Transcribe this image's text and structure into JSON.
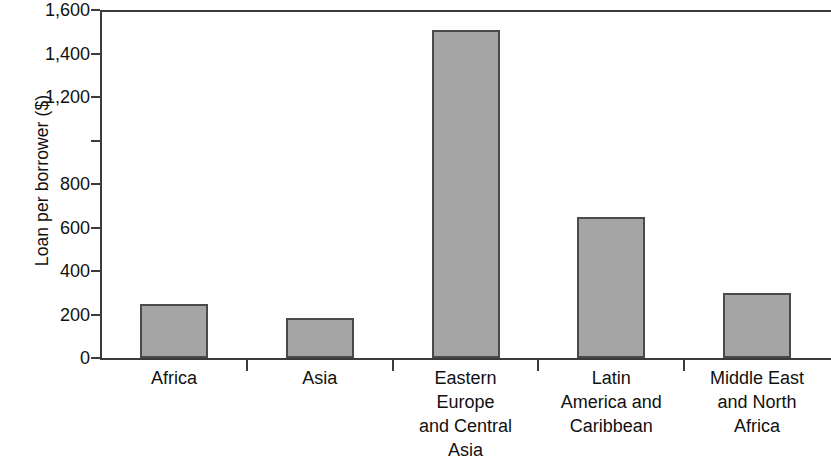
{
  "chart_data": {
    "type": "bar",
    "title": "",
    "subtitle": "",
    "xlabel": "",
    "ylabel": "Loan per borrower ($)",
    "categories": [
      "Africa",
      "Eastern Europe and Central Asia",
      "Asia",
      "Latin America and Caribbean",
      "Middle East and North Africa"
    ],
    "category_display_lines": [
      [
        "Africa"
      ],
      [
        "Asia"
      ],
      [
        "Eastern",
        "Europe",
        "and Central",
        "Asia"
      ],
      [
        "Latin",
        "America and",
        "Caribbean"
      ],
      [
        "Middle East",
        "and North",
        "Africa"
      ]
    ],
    "values": [
      250,
      185,
      1510,
      650,
      300
    ],
    "ylim": [
      0,
      1600
    ],
    "ytick_values": [
      0,
      200,
      400,
      600,
      800,
      1000,
      1200,
      1400,
      1600
    ],
    "ytick_labels": [
      "0",
      "200",
      "400",
      "600",
      "800",
      "",
      "1,200",
      "1,400",
      "1,600"
    ],
    "grid": false,
    "legend": null,
    "legend_position": "none",
    "bar_fill_color": "#a5a5a5",
    "bar_edge_color": "#4a4a4a",
    "axis_color": "#3b3b3b",
    "background_color": "#ffffff",
    "series": [
      {
        "name": "Loan per borrower ($)",
        "values": [
          250,
          185,
          1510,
          650,
          300
        ]
      }
    ],
    "bars": [
      {
        "category": "Africa",
        "value": 250
      },
      {
        "category": "Asia",
        "value": 185
      },
      {
        "category": "Eastern Europe and Central Asia",
        "value": 1510
      },
      {
        "category": "Latin America and Caribbean",
        "value": 650
      },
      {
        "category": "Middle East and North Africa",
        "value": 300
      }
    ]
  }
}
